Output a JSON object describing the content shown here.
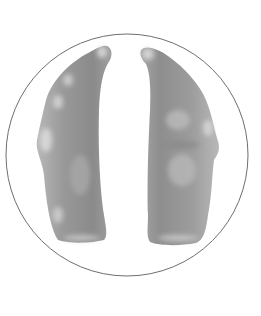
{
  "figure": {
    "type": "anatomical-illustration",
    "colors": {
      "background": "#ffffff",
      "circle_stroke": "#6e6e6e",
      "lobe_fill": "#9a9a9a",
      "lobe_dark": "#7c7c7c",
      "lobe_highlight": "#d8d8d8"
    }
  }
}
